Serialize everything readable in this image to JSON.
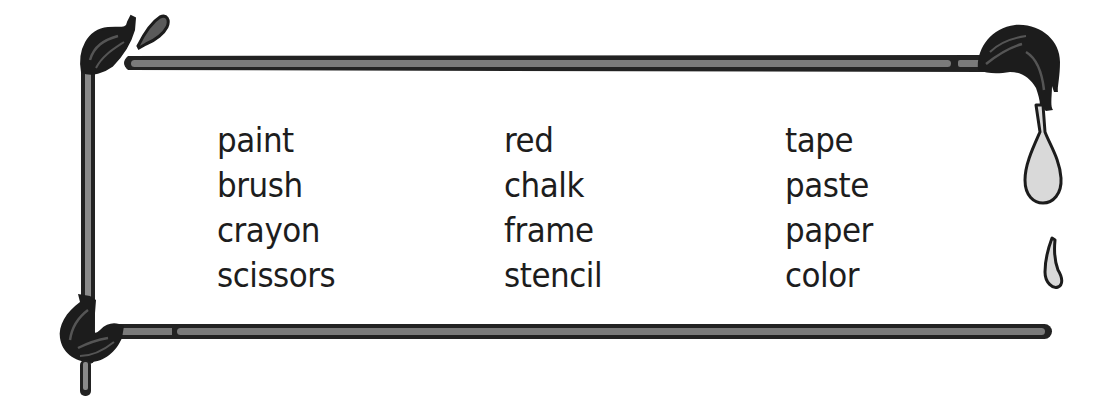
{
  "worksheet": {
    "title": "Art supplies word list",
    "colors": {
      "outline": "#222222",
      "handle_fill": "#787878",
      "bristles": "#1c1c1c",
      "bristle_highlight": "#5a5a5a",
      "drip_fill": "#d9d9d9",
      "text": "#1d1d1d",
      "background": "#ffffff"
    },
    "columns": [
      {
        "words": [
          "paint",
          "brush",
          "crayon",
          "scissors"
        ]
      },
      {
        "words": [
          "red",
          "chalk",
          "frame",
          "stencil"
        ]
      },
      {
        "words": [
          "tape",
          "paste",
          "paper",
          "color"
        ]
      }
    ],
    "decorations": [
      "paintbrush-top-left-icon",
      "paint-splash-icon",
      "paintbrush-top-right-icon",
      "paint-drip-large-icon",
      "paint-drip-small-icon",
      "paintbrush-bottom-left-icon"
    ]
  }
}
